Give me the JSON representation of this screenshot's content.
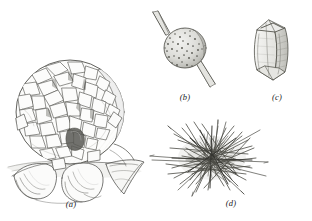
{
  "plate": {
    "title": "Plate of four drawn specimens",
    "background_color": "#ffffff",
    "ink_color": "#3a3a38",
    "width": 312,
    "height": 221
  },
  "figures": [
    {
      "id": "a",
      "caption": "(a)",
      "subject": "plated-sphere-on-ruffled-base",
      "description": "Large globular body densely covered with irregular angular overlapping plates, seated on a broad wavy skirt-like base",
      "position": {
        "x": 2,
        "y": 52,
        "width": 152,
        "height": 150
      },
      "shading": "cross-hatched pen and ink"
    },
    {
      "id": "b",
      "caption": "(b)",
      "subject": "spiny-granular-sphere",
      "description": "Small round granular stippled sphere pierced by two long tapering spines, one to the upper left and one to the lower right",
      "position": {
        "x": 150,
        "y": 4,
        "width": 70,
        "height": 86
      },
      "shading": "fine stipple"
    },
    {
      "id": "c",
      "caption": "(c)",
      "subject": "faceted-spindle",
      "description": "Elongated barrel or spindle shaped body with flat facets and pointed ends, tilted to the right",
      "position": {
        "x": 243,
        "y": 8,
        "width": 56,
        "height": 82
      },
      "shading": "light wash with outline facets"
    },
    {
      "id": "d",
      "caption": "(d)",
      "subject": "needle-spicule-tangle",
      "description": "Dense tangled mass of straight needle-like spicules radiating in many directions",
      "position": {
        "x": 148,
        "y": 118,
        "width": 124,
        "height": 78
      },
      "shading": "overlapping fine line strokes"
    }
  ],
  "captions": {
    "a": "(a)",
    "b": "(b)",
    "c": "(c)",
    "d": "(d)"
  }
}
